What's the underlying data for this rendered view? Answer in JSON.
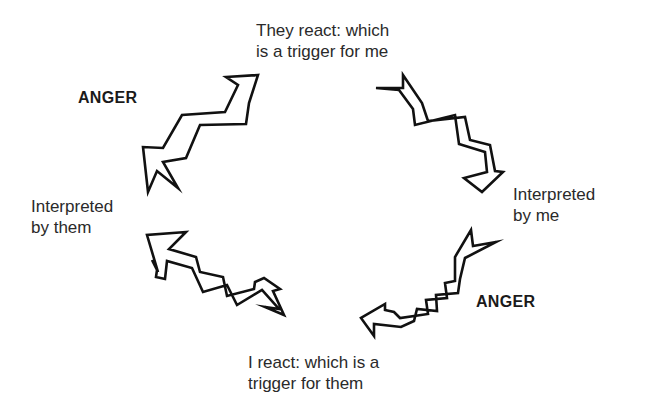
{
  "diagram": {
    "type": "cycle",
    "nodes": [
      {
        "id": "top",
        "lines": [
          "They react: which",
          "is a trigger for me"
        ]
      },
      {
        "id": "right",
        "lines": [
          "Interpreted",
          "by me"
        ]
      },
      {
        "id": "bottom",
        "lines": [
          "I react: which is a",
          "trigger for them"
        ]
      },
      {
        "id": "left",
        "lines": [
          "Interpreted",
          "by them"
        ]
      }
    ],
    "emotion_labels": [
      {
        "id": "anger-top-left",
        "text": "ANGER"
      },
      {
        "id": "anger-bottom-right",
        "text": "ANGER"
      }
    ],
    "edges": [
      {
        "from": "left",
        "to": "top",
        "style": "zigzag-arrow"
      },
      {
        "from": "top",
        "to": "right",
        "style": "zigzag-arrow"
      },
      {
        "from": "right",
        "to": "bottom",
        "style": "zigzag-arrow"
      },
      {
        "from": "bottom",
        "to": "left",
        "style": "zigzag-arrow"
      }
    ],
    "colors": {
      "background": "#ffffff",
      "stroke": "#111111",
      "text": "#2a2a2a"
    }
  }
}
